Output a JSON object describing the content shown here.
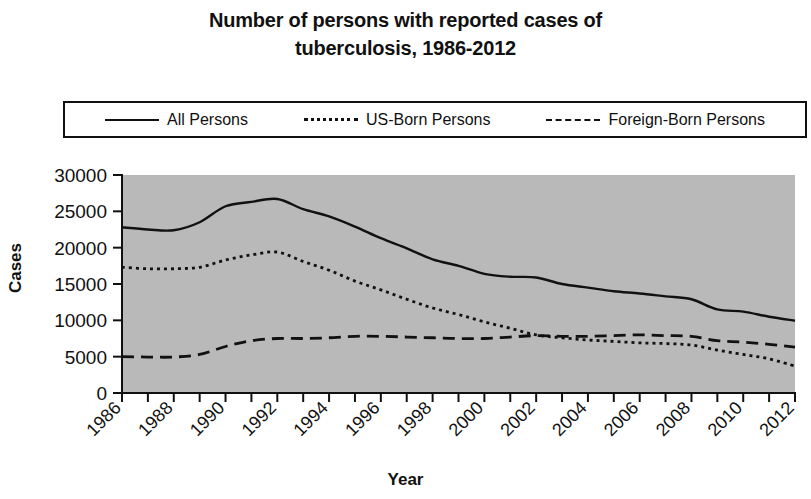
{
  "title": {
    "line1": "Number of persons with reported cases of",
    "line2": "tuberculosis, 1986-2012"
  },
  "legend": {
    "position": "above-plot",
    "entries": [
      {
        "label": "All Persons",
        "style": "solid"
      },
      {
        "label": "US-Born Persons",
        "style": "dotted"
      },
      {
        "label": "Foreign-Born Persons",
        "style": "dashed"
      }
    ]
  },
  "axes": {
    "y_title": "Cases",
    "x_title": "Year",
    "y_ticks": [
      "30000",
      "25000",
      "20000",
      "15000",
      "10000",
      "5000",
      "0"
    ],
    "x_ticks": [
      "1986",
      "1988",
      "1990",
      "1992",
      "1994",
      "1996",
      "1998",
      "2000",
      "2002",
      "2004",
      "2006",
      "2008",
      "2010",
      "2012"
    ]
  },
  "colors": {
    "plot_background": "#b9b9b9",
    "ink": "#111111",
    "page_background": "#ffffff"
  },
  "chart_data": {
    "type": "line",
    "title": "Number of persons with reported cases of tuberculosis, 1986-2012",
    "xlabel": "Year",
    "ylabel": "Cases",
    "ylim": [
      0,
      30000
    ],
    "xlim": [
      1986,
      2012
    ],
    "grid": false,
    "legend_position": "top",
    "x": [
      1986,
      1987,
      1988,
      1989,
      1990,
      1991,
      1992,
      1993,
      1994,
      1995,
      1996,
      1997,
      1998,
      1999,
      2000,
      2001,
      2002,
      2003,
      2004,
      2005,
      2006,
      2007,
      2008,
      2009,
      2010,
      2011,
      2012
    ],
    "series": [
      {
        "name": "All Persons",
        "style": "solid",
        "values": [
          22800,
          22500,
          22400,
          23500,
          25700,
          26300,
          26700,
          25300,
          24300,
          22900,
          21300,
          19900,
          18400,
          17500,
          16400,
          16000,
          15900,
          15000,
          14500,
          14000,
          13700,
          13300,
          12900,
          11500,
          11200,
          10500,
          9950
        ]
      },
      {
        "name": "US-Born Persons",
        "style": "dotted",
        "values": [
          17300,
          17100,
          17100,
          17300,
          18300,
          19000,
          19400,
          18100,
          16900,
          15400,
          14200,
          12900,
          11700,
          10800,
          9800,
          8900,
          8000,
          7600,
          7300,
          7100,
          6900,
          6800,
          6600,
          5900,
          5300,
          4700,
          3700
        ]
      },
      {
        "name": "Foreign-Born Persons",
        "style": "dashed",
        "values": [
          5000,
          4950,
          4950,
          5300,
          6400,
          7200,
          7500,
          7500,
          7600,
          7800,
          7800,
          7700,
          7600,
          7500,
          7500,
          7700,
          7900,
          7800,
          7800,
          7900,
          8000,
          7900,
          7800,
          7200,
          7000,
          6700,
          6300
        ]
      }
    ]
  }
}
